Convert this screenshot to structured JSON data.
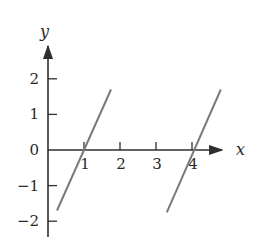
{
  "chart_data": {
    "type": "line",
    "title": "",
    "xlabel": "x",
    "ylabel": "y",
    "xlim": [
      0,
      4.9
    ],
    "ylim": [
      -2.4,
      2.9
    ],
    "grid": false,
    "legend": null,
    "x_ticks": [
      1,
      2,
      3,
      4
    ],
    "x_tick_labels": [
      "1",
      "2",
      "3",
      "4"
    ],
    "y_ticks": [
      2,
      1,
      0,
      -1,
      -2
    ],
    "y_tick_labels": [
      "2",
      "1",
      "0",
      "−1",
      "−2"
    ],
    "series": [
      {
        "name": "segment-1",
        "x": [
          0.25,
          1.75
        ],
        "y": [
          -1.7,
          1.7
        ]
      },
      {
        "name": "segment-2",
        "x": [
          3.3,
          4.8
        ],
        "y": [
          -1.75,
          1.7
        ]
      }
    ],
    "colors": {
      "axis": "#2e2e2e",
      "series": "#7a7a7a",
      "text": "#2a2a2a"
    }
  }
}
